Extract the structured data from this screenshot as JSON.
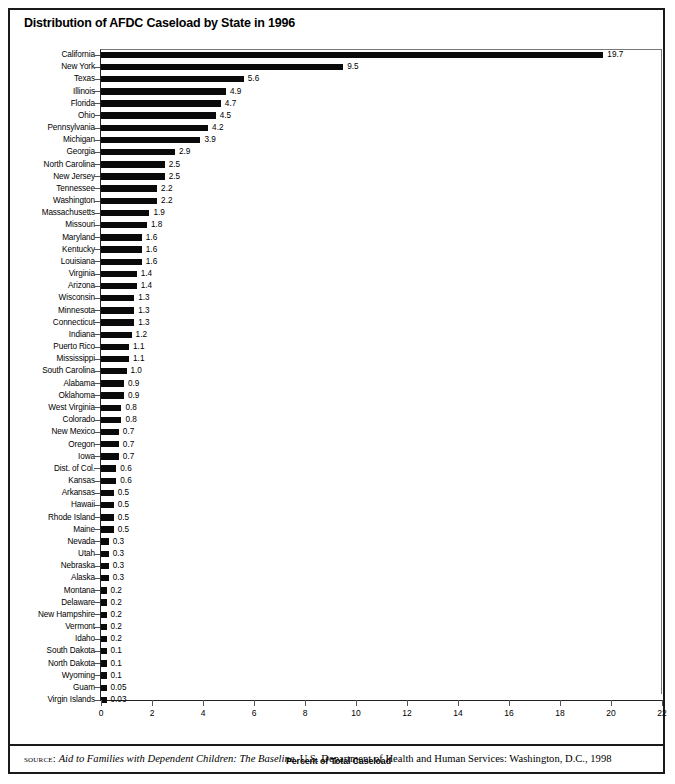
{
  "chart_title": "Distribution of AFDC Caseload by State in 1996",
  "axis": {
    "xlabel": "Percent of Total Caseload",
    "xticks": [
      0,
      2,
      4,
      6,
      8,
      10,
      12,
      14,
      16,
      18,
      20,
      22
    ]
  },
  "source": {
    "kicker": "source:",
    "italic_title": "Aid to Families with Dependent Children: The Baseline",
    "rest": ". U.S. Department of Health and Human Services: Washington, D.C., 1998"
  },
  "chart_data": {
    "type": "bar",
    "orientation": "horizontal",
    "title": "Distribution of AFDC Caseload by State in 1996",
    "xlabel": "Percent of Total Caseload",
    "ylabel": "",
    "xlim": [
      0,
      22
    ],
    "grid": false,
    "legend": null,
    "value_labels": true,
    "categories": [
      "California",
      "New York",
      "Texas",
      "Illinois",
      "Florida",
      "Ohio",
      "Pennsylvania",
      "Michigan",
      "Georgia",
      "North Carolina",
      "New Jersey",
      "Tennessee",
      "Washington",
      "Massachusetts",
      "Missouri",
      "Maryland",
      "Kentucky",
      "Louisiana",
      "Virginia",
      "Arizona",
      "Wisconsin",
      "Minnesota",
      "Connecticut",
      "Indiana",
      "Puerto Rico",
      "Mississippi",
      "South Carolina",
      "Alabama",
      "Oklahoma",
      "West Virginia",
      "Colorado",
      "New Mexico",
      "Oregon",
      "Iowa",
      "Dist. of Col.",
      "Kansas",
      "Arkansas",
      "Hawaii",
      "Rhode Island",
      "Maine",
      "Nevada",
      "Utah",
      "Nebraska",
      "Alaska",
      "Montana",
      "Delaware",
      "New Hampshire",
      "Vermont",
      "Idaho",
      "South Dakota",
      "North Dakota",
      "Wyoming",
      "Guam",
      "Virgin Islands"
    ],
    "values": [
      19.7,
      9.5,
      5.6,
      4.9,
      4.7,
      4.5,
      4.2,
      3.9,
      2.9,
      2.5,
      2.5,
      2.2,
      2.2,
      1.9,
      1.8,
      1.6,
      1.6,
      1.6,
      1.4,
      1.4,
      1.3,
      1.3,
      1.3,
      1.2,
      1.1,
      1.1,
      1.0,
      0.9,
      0.9,
      0.8,
      0.8,
      0.7,
      0.7,
      0.7,
      0.6,
      0.6,
      0.5,
      0.5,
      0.5,
      0.5,
      0.3,
      0.3,
      0.3,
      0.3,
      0.2,
      0.2,
      0.2,
      0.2,
      0.2,
      0.1,
      0.1,
      0.1,
      0.05,
      0.03
    ],
    "value_label_text": [
      "19.7",
      "9.5",
      "5.6",
      "4.9",
      "4.7",
      "4.5",
      "4.2",
      "3.9",
      "2.9",
      "2.5",
      "2.5",
      "2.2",
      "2.2",
      "1.9",
      "1.8",
      "1.6",
      "1.6",
      "1.6",
      "1.4",
      "1.4",
      "1.3",
      "1.3",
      "1.3",
      "1.2",
      "1.1",
      "1.1",
      "1.0",
      "0.9",
      "0.9",
      "0.8",
      "0.8",
      "0.7",
      "0.7",
      "0.7",
      "0.6",
      "0.6",
      "0.5",
      "0.5",
      "0.5",
      "0.5",
      "0.3",
      "0.3",
      "0.3",
      "0.3",
      "0.2",
      "0.2",
      "0.2",
      "0.2",
      "0.2",
      "0.1",
      "0.1",
      "0.1",
      "0.05",
      "0.03"
    ]
  }
}
